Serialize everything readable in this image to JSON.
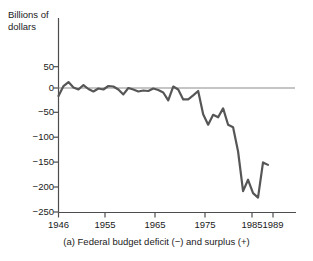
{
  "chart_data": {
    "type": "line",
    "title": "",
    "caption": "(a) Federal budget deficit (−) and surplus (+)",
    "ylabel": "Billions of\ndollars",
    "xlabel": "",
    "grid": false,
    "legend": "none",
    "line_color": "#565656",
    "zero_line_color": "#8c8c8c",
    "axis_color": "#4d4d4d",
    "xlim": [
      1946,
      1992
    ],
    "ylim": [
      -250,
      62
    ],
    "yticks": [
      50,
      0,
      -50,
      -100,
      -150,
      -200,
      -250
    ],
    "ytick_labels": [
      "50",
      "0",
      "−50",
      "−100",
      "−150",
      "−200",
      "−250"
    ],
    "xticks": [
      1946,
      1955,
      1965,
      1975,
      1985,
      1989
    ],
    "xtick_labels": [
      "1946",
      "1955",
      "1965",
      "1975",
      "1985",
      "1989"
    ],
    "x": [
      1946,
      1947,
      1948,
      1949,
      1950,
      1951,
      1952,
      1953,
      1954,
      1955,
      1956,
      1957,
      1958,
      1959,
      1960,
      1961,
      1962,
      1963,
      1964,
      1965,
      1966,
      1967,
      1968,
      1969,
      1970,
      1971,
      1972,
      1973,
      1974,
      1975,
      1976,
      1977,
      1978,
      1979,
      1980,
      1981,
      1982,
      1983,
      1984,
      1985,
      1986,
      1987,
      1988
    ],
    "values": [
      -16,
      4,
      12,
      1,
      -3,
      6,
      -2,
      -7,
      -1,
      -3,
      4,
      3,
      -3,
      -13,
      0,
      -3,
      -7,
      -5,
      -6,
      -1,
      -4,
      -9,
      -25,
      3,
      -3,
      -23,
      -23,
      -15,
      -6,
      -53,
      -74,
      -54,
      -59,
      -41,
      -74,
      -79,
      -128,
      -208,
      -185,
      -212,
      -221,
      -150,
      -155
    ],
    "series_name": "Federal budget deficit (−) and surplus (+)",
    "units": "Billions of dollars"
  }
}
